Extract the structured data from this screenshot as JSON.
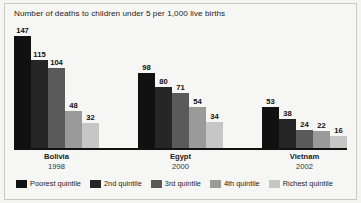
{
  "chart_data": {
    "type": "bar",
    "title": "Number of deaths to children under 5 per 1,000 live births",
    "xlabel": "",
    "ylabel": "",
    "ylim": [
      0,
      147
    ],
    "grid": false,
    "legend_position": "bottom",
    "categories": [
      "Bolivia",
      "Egypt",
      "Vietnam"
    ],
    "category_years": [
      "1998",
      "2000",
      "2002"
    ],
    "series": [
      {
        "name": "Poorest quintile",
        "color": "#111111",
        "values": [
          147,
          98,
          53
        ]
      },
      {
        "name": "2nd quintile",
        "color": "#262626",
        "values": [
          115,
          80,
          38
        ]
      },
      {
        "name": "3rd quintile",
        "color": "#5a5a5a",
        "values": [
          104,
          71,
          24
        ]
      },
      {
        "name": "4th quintile",
        "color": "#9a9a9a",
        "values": [
          48,
          54,
          22
        ]
      },
      {
        "name": "Richest quintile",
        "color": "#c6c6c6",
        "values": [
          32,
          34,
          16
        ]
      }
    ]
  },
  "groups": [
    {
      "country": "Bolivia",
      "year": "1998",
      "bars": [
        {
          "label": "147",
          "value": 147,
          "color": "#111111",
          "series": "Poorest quintile"
        },
        {
          "label": "115",
          "value": 115,
          "color": "#262626",
          "series": "2nd quintile"
        },
        {
          "label": "104",
          "value": 104,
          "color": "#5a5a5a",
          "series": "3rd quintile"
        },
        {
          "label": "48",
          "value": 48,
          "color": "#9a9a9a",
          "series": "4th quintile"
        },
        {
          "label": "32",
          "value": 32,
          "color": "#c6c6c6",
          "series": "Richest quintile"
        }
      ]
    },
    {
      "country": "Egypt",
      "year": "2000",
      "bars": [
        {
          "label": "98",
          "value": 98,
          "color": "#111111",
          "series": "Poorest quintile"
        },
        {
          "label": "80",
          "value": 80,
          "color": "#262626",
          "series": "2nd quintile"
        },
        {
          "label": "71",
          "value": 71,
          "color": "#5a5a5a",
          "series": "3rd quintile"
        },
        {
          "label": "54",
          "value": 54,
          "color": "#9a9a9a",
          "series": "4th quintile"
        },
        {
          "label": "34",
          "value": 34,
          "color": "#c6c6c6",
          "series": "Richest quintile"
        }
      ]
    },
    {
      "country": "Vietnam",
      "year": "2002",
      "bars": [
        {
          "label": "53",
          "value": 53,
          "color": "#111111",
          "series": "Poorest quintile"
        },
        {
          "label": "38",
          "value": 38,
          "color": "#262626",
          "series": "2nd quintile"
        },
        {
          "label": "24",
          "value": 24,
          "color": "#5a5a5a",
          "series": "3rd quintile"
        },
        {
          "label": "22",
          "value": 22,
          "color": "#9a9a9a",
          "series": "4th quintile"
        },
        {
          "label": "16",
          "value": 16,
          "color": "#c6c6c6",
          "series": "Richest quintile"
        }
      ]
    }
  ],
  "legend": [
    {
      "label": "Poorest quintile",
      "color": "#111111"
    },
    {
      "label": "2nd quintile",
      "color": "#262626"
    },
    {
      "label": "3rd quintile",
      "color": "#5a5a5a"
    },
    {
      "label": "4th quintile",
      "color": "#9a9a9a"
    },
    {
      "label": "Richest quintile",
      "color": "#c6c6c6"
    }
  ]
}
